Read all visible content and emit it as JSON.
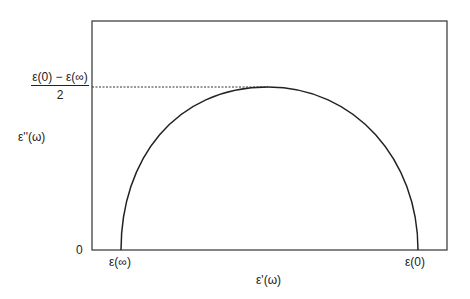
{
  "diagram": {
    "type": "cole-cole-semicircle",
    "y_axis_label": "ε''(ω)",
    "x_axis_label": "ε'(ω)",
    "y_origin_label": "0",
    "peak_label_numerator": "ε(0) − ε(∞)",
    "peak_label_denominator": "2",
    "x_left_label": "ε(∞)",
    "x_right_label": "ε(0)",
    "colors": {
      "line": "#222222",
      "background": "#ffffff"
    }
  }
}
